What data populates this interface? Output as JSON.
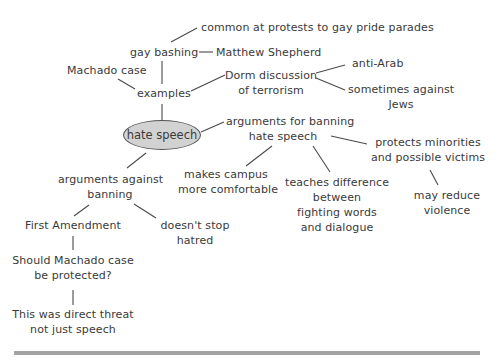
{
  "diagram": {
    "type": "concept-map",
    "center": "hate speech",
    "nodes": {
      "common_at_protests": "common at protests to gay pride parades",
      "gay_bashing": "gay bashing",
      "matthew_shepherd": "Matthew Shepherd",
      "machado_case": "Machado case",
      "examples": "examples",
      "dorm_discussion_1": "Dorm discussion",
      "dorm_discussion_2": "of terrorism",
      "anti_arab": "anti-Arab",
      "against_jews_1": "sometimes against",
      "against_jews_2": "Jews",
      "hate_speech": "hate speech",
      "args_for_1": "arguments for banning",
      "args_for_2": "hate speech",
      "protects_1": "protects minorities",
      "protects_2": "and possible victims",
      "campus_1": "makes campus",
      "campus_2": "more comfortable",
      "teaches_1": "teaches difference",
      "teaches_2": "between",
      "teaches_3": "fighting words",
      "teaches_4": "and dialogue",
      "reduce_1": "may reduce",
      "reduce_2": "violence",
      "args_against_1": "arguments against",
      "args_against_2": "banning",
      "first_amendment": "First Amendment",
      "doesnt_stop_1": "doesn't stop",
      "doesnt_stop_2": "hatred",
      "should_machado_1": "Should Machado case",
      "should_machado_2": "be protected?",
      "direct_threat_1": "This was direct threat",
      "direct_threat_2": "not just speech"
    },
    "edges": [
      [
        "gay bashing",
        "common at protests to gay pride parades"
      ],
      [
        "gay bashing",
        "Matthew Shepherd"
      ],
      [
        "gay bashing",
        "examples"
      ],
      [
        "Machado case",
        "examples"
      ],
      [
        "examples",
        "Dorm discussion of terrorism"
      ],
      [
        "Dorm discussion of terrorism",
        "anti-Arab"
      ],
      [
        "Dorm discussion of terrorism",
        "sometimes against Jews"
      ],
      [
        "examples",
        "hate speech"
      ],
      [
        "hate speech",
        "arguments for banning hate speech"
      ],
      [
        "hate speech",
        "arguments against banning"
      ],
      [
        "arguments for banning hate speech",
        "makes campus more comfortable"
      ],
      [
        "arguments for banning hate speech",
        "teaches difference between fighting words and dialogue"
      ],
      [
        "arguments for banning hate speech",
        "protects minorities and possible victims"
      ],
      [
        "protects minorities and possible victims",
        "may reduce violence"
      ],
      [
        "arguments against banning",
        "First Amendment"
      ],
      [
        "arguments against banning",
        "doesn't stop hatred"
      ],
      [
        "First Amendment",
        "Should Machado case be protected?"
      ],
      [
        "Should Machado case be protected?",
        "This was direct threat not just speech"
      ]
    ],
    "colors": {
      "ellipse_fill": "#d2d2d2",
      "line": "#4a4a4a",
      "text": "#3a3a3a",
      "bottom_rule": "#a3a3a3"
    }
  }
}
